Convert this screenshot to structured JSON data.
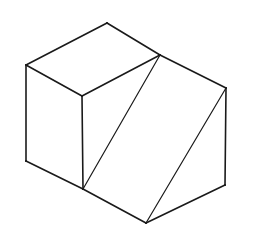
{
  "diagram": {
    "kind": "isometric-line-drawing",
    "stroke_color": "#1a1a1a",
    "background": "#ffffff",
    "vertices": {
      "A": [
        107,
        23
      ],
      "B": [
        26,
        65
      ],
      "C": [
        82,
        96
      ],
      "D": [
        160,
        55
      ],
      "E": [
        226,
        88
      ],
      "F": [
        26,
        161
      ],
      "G": [
        83,
        189
      ],
      "H": [
        146,
        223
      ],
      "I": [
        225,
        185
      ]
    },
    "edges": [
      [
        "A",
        "B"
      ],
      [
        "A",
        "D"
      ],
      [
        "B",
        "C"
      ],
      [
        "C",
        "D"
      ],
      [
        "B",
        "F"
      ],
      [
        "C",
        "G"
      ],
      [
        "F",
        "G"
      ],
      [
        "G",
        "H"
      ],
      [
        "D",
        "E"
      ],
      [
        "D",
        "G"
      ],
      [
        "E",
        "H"
      ],
      [
        "E",
        "I"
      ],
      [
        "H",
        "I"
      ]
    ]
  }
}
